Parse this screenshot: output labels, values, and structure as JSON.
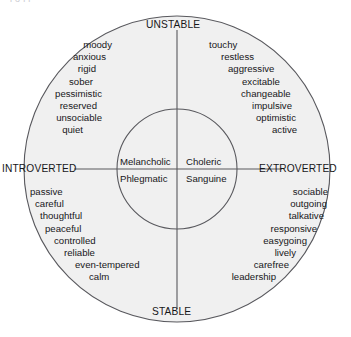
{
  "figure": {
    "top_clipped_text": "l  o  l     l",
    "colors": {
      "outer_fill": "#f0f0f0",
      "inner_fill": "#f0f0f0",
      "stroke": "#58585d",
      "text": "#17171a",
      "background": "#ffffff"
    },
    "geometry": {
      "center_x": 177,
      "center_y": 169,
      "outer_radius": 153,
      "inner_radius": 60
    }
  },
  "axes": {
    "vertical": {
      "top_label": "UNSTABLE",
      "bottom_label": "STABLE"
    },
    "horizontal": {
      "left_label": "INTROVERTED",
      "right_label": "EXTROVERTED"
    }
  },
  "quadrants": {
    "upper_left": {
      "temperament": "Melancholic",
      "traits": [
        "moody",
        "anxious",
        "rigid",
        "sober",
        "pessimistic",
        "reserved",
        "unsociable",
        "quiet"
      ]
    },
    "upper_right": {
      "temperament": "Choleric",
      "traits": [
        "touchy",
        "restless",
        "aggressive",
        "excitable",
        "changeable",
        "impulsive",
        "optimistic",
        "active"
      ]
    },
    "lower_left": {
      "temperament": "Phlegmatic",
      "traits": [
        "passive",
        "careful",
        "thoughtful",
        "peaceful",
        "controlled",
        "reliable",
        "even-tempered",
        "calm"
      ]
    },
    "lower_right": {
      "temperament": "Sanguine",
      "traits": [
        "sociable",
        "outgoing",
        "talkative",
        "responsive",
        "easygoing",
        "lively",
        "carefree",
        "leadership"
      ]
    }
  }
}
